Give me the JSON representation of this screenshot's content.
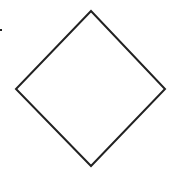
{
  "diagram": {
    "shapes": [
      {
        "type": "diamond",
        "label": "",
        "points": [
          [
            91,
            11
          ],
          [
            165,
            89
          ],
          [
            91,
            166
          ],
          [
            16,
            89
          ]
        ],
        "stroke": "#222222",
        "fill": "#ffffff",
        "stroke_width": 2
      }
    ],
    "marks": [
      {
        "type": "dot",
        "x": 1,
        "y": 30,
        "size": 2,
        "color": "#222222"
      }
    ]
  }
}
